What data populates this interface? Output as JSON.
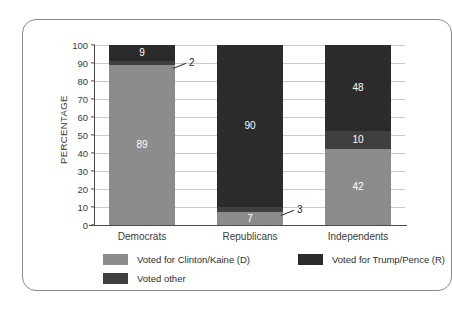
{
  "chart_data": {
    "type": "bar",
    "subtype": "stacked-bar",
    "title": "",
    "xlabel": "",
    "ylabel": "PERCENTAGE",
    "ylim": [
      0,
      100
    ],
    "ytick_step": 10,
    "yticks": [
      "100",
      "90",
      "80",
      "70",
      "60",
      "50",
      "40",
      "30",
      "20",
      "10",
      "0"
    ],
    "grid": true,
    "legend_position": "bottom-left",
    "categories": [
      "Democrats",
      "Republicans",
      "Independents"
    ],
    "series": [
      {
        "name": "Voted for Clinton/Kaine (D)",
        "color": "#8c8c8c",
        "values": [
          89,
          7,
          42
        ]
      },
      {
        "name": "Voted for Trump/Pence (R)",
        "color": "#2b2b2b",
        "values": [
          9,
          90,
          48
        ]
      },
      {
        "name": "Voted other",
        "color": "#3f3f3f",
        "values": [
          2,
          3,
          10
        ]
      }
    ],
    "annotations": [
      {
        "text": "2",
        "category": "Democrats",
        "series": "Voted other",
        "style": "leader-line"
      },
      {
        "text": "3",
        "category": "Republicans",
        "series": "Voted other",
        "style": "leader-line"
      }
    ]
  },
  "bars": [
    {
      "category": "Democrats",
      "segments": [
        {
          "series": "Voted for Trump/Pence (R)",
          "value": 9,
          "label": "9",
          "inside": true
        },
        {
          "series": "Voted other",
          "value": 2,
          "label": "2",
          "inside": false
        },
        {
          "series": "Voted for Clinton/Kaine (D)",
          "value": 89,
          "label": "89",
          "inside": true
        }
      ]
    },
    {
      "category": "Republicans",
      "segments": [
        {
          "series": "Voted for Trump/Pence (R)",
          "value": 90,
          "label": "90",
          "inside": true
        },
        {
          "series": "Voted other",
          "value": 3,
          "label": "3",
          "inside": false
        },
        {
          "series": "Voted for Clinton/Kaine (D)",
          "value": 7,
          "label": "7",
          "inside": true
        }
      ]
    },
    {
      "category": "Independents",
      "segments": [
        {
          "series": "Voted for Trump/Pence (R)",
          "value": 48,
          "label": "48",
          "inside": true
        },
        {
          "series": "Voted other",
          "value": 10,
          "label": "10",
          "inside": true
        },
        {
          "series": "Voted for Clinton/Kaine (D)",
          "value": 42,
          "label": "42",
          "inside": true
        }
      ]
    }
  ],
  "legend": {
    "items": [
      {
        "label": "Voted for Clinton/Kaine (D)",
        "color": "#8c8c8c"
      },
      {
        "label": "Voted for Trump/Pence (R)",
        "color": "#2b2b2b"
      },
      {
        "label": "Voted other",
        "color": "#3f3f3f"
      }
    ]
  },
  "colors": {
    "clinton": "#8c8c8c",
    "trump": "#2b2b2b",
    "other": "#3f3f3f",
    "grid": "#c9c9c9",
    "axis": "#4a4a4a",
    "text": "#3a3a3a",
    "card_border": "#8a8a8a",
    "background": "#ffffff"
  }
}
